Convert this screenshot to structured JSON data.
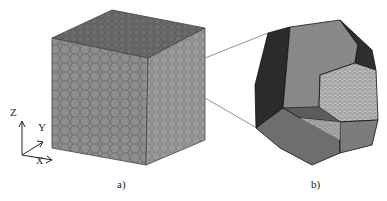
{
  "panels": [
    {
      "label": "a)",
      "description": "cube of hexagonal grains"
    },
    {
      "label": "b)",
      "description": "single polyhedral grain with mesh"
    }
  ],
  "axes": {
    "z": "Z",
    "y": "Y",
    "x": "X"
  },
  "colors": {
    "cube_top": "#6e6e6e",
    "cube_front": "#8c8c8c",
    "cube_right": "#9a9a9a",
    "grain_dark": "#2b2b2b",
    "grain_mid": "#7a7a7a",
    "grain_light": "#9b9b9b"
  }
}
